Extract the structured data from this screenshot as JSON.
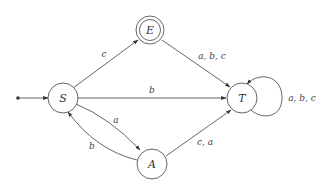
{
  "diagram": {
    "type": "finite-automaton",
    "states": [
      {
        "id": "S",
        "label": "S",
        "initial": true,
        "accepting": false
      },
      {
        "id": "E",
        "label": "E",
        "initial": false,
        "accepting": true
      },
      {
        "id": "T",
        "label": "T",
        "initial": false,
        "accepting": false
      },
      {
        "id": "A",
        "label": "A",
        "initial": false,
        "accepting": false
      }
    ],
    "transitions": [
      {
        "from": "S",
        "to": "E",
        "label": "c"
      },
      {
        "from": "S",
        "to": "T",
        "label": "b"
      },
      {
        "from": "S",
        "to": "A",
        "label": "a"
      },
      {
        "from": "A",
        "to": "S",
        "label": "b"
      },
      {
        "from": "E",
        "to": "T",
        "label": "a, b, c"
      },
      {
        "from": "A",
        "to": "T",
        "label": "c, a"
      },
      {
        "from": "T",
        "to": "T",
        "label": "a, b, c"
      }
    ]
  }
}
